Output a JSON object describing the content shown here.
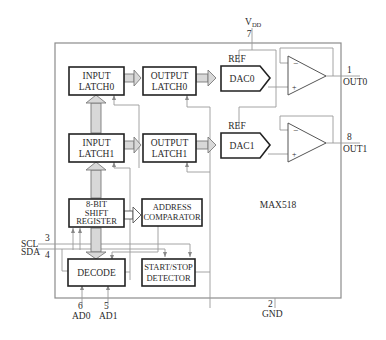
{
  "diagram": {
    "chip_name": "MAX518",
    "blocks": {
      "input_latch0": [
        "INPUT",
        "LATCH0"
      ],
      "input_latch1": [
        "INPUT",
        "LATCH1"
      ],
      "output_latch0": [
        "OUTPUT",
        "LATCH0"
      ],
      "output_latch1": [
        "OUTPUT",
        "LATCH1"
      ],
      "dac0": "DAC0",
      "dac1": "DAC1",
      "shift_register": [
        "8-BIT",
        "SHIFT",
        "REGISTER"
      ],
      "address_comparator": [
        "ADDRESS",
        "COMPARATOR"
      ],
      "decode": "DECODE",
      "start_stop_detector": [
        "START/STOP",
        "DETECTOR"
      ]
    },
    "ref_labels": [
      "REF",
      "REF"
    ],
    "amp_signs": {
      "minus": "−",
      "plus": "+"
    },
    "pins": {
      "vdd": {
        "name": "V",
        "subscript": "DD",
        "number": "7"
      },
      "out0": {
        "name": "OUT0",
        "number": "1"
      },
      "out1": {
        "name": "OUT1",
        "number": "8"
      },
      "scl": {
        "name": "SCL",
        "number": "3"
      },
      "sda": {
        "name": "SDA",
        "number": "4"
      },
      "ad0": {
        "name": "AD0",
        "number": "6"
      },
      "ad1": {
        "name": "AD1",
        "number": "5"
      },
      "gnd": {
        "name": "GND",
        "number": "2"
      }
    }
  }
}
